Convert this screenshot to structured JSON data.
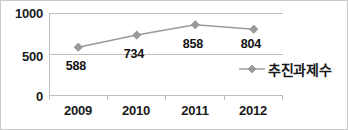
{
  "chart_data": {
    "type": "line",
    "title": "",
    "xlabel": "",
    "ylabel": "",
    "categories": [
      "2009",
      "2010",
      "2011",
      "2012"
    ],
    "series": [
      {
        "name": "추진과제수",
        "values": [
          588,
          734,
          858,
          804
        ],
        "color": "#9a9a9a",
        "marker": "diamond"
      }
    ],
    "data_labels": [
      "588",
      "734",
      "858",
      "804"
    ],
    "ylim": [
      0,
      1000
    ],
    "yticks": [
      0,
      500,
      1000
    ],
    "ytick_labels": [
      "0",
      "500",
      "1000"
    ],
    "grid": true,
    "legend_position": "right-inside"
  },
  "legend": {
    "marker_name": "diamond-marker",
    "label": "추진과제수"
  },
  "axes": {
    "y_labels": [
      "1000",
      "500",
      "0"
    ],
    "x_labels": [
      "2009",
      "2010",
      "2011",
      "2012"
    ]
  },
  "colors": {
    "series": "#9a9a9a",
    "grid": "#bfbfbf",
    "text": "#1a1a1a",
    "border": "#c9c9c9",
    "background": "#ffffff"
  }
}
